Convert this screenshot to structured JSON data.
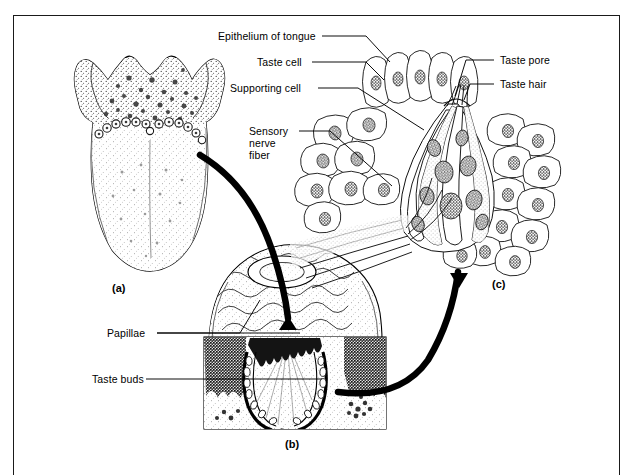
{
  "figure": {
    "background_color": "#ffffff",
    "ink_color": "#000000",
    "border_color": "#1a1a1a"
  },
  "labels": {
    "epithelium_of_tongue": "Epithelium of tongue",
    "taste_cell": "Taste cell",
    "supporting_cell": "Supporting cell",
    "sensory_nerve_fiber_line1": "Sensory",
    "sensory_nerve_fiber_line2": "nerve",
    "sensory_nerve_fiber_line3": "fiber",
    "taste_pore": "Taste pore",
    "taste_hair": "Taste hair",
    "papillae": "Papillae",
    "taste_buds": "Taste buds"
  },
  "panels": {
    "a": {
      "tag": "(a)",
      "subject": "dorsal-view-of-tongue"
    },
    "b": {
      "tag": "(b)",
      "subject": "block-section-of-circumvallate-papilla"
    },
    "c": {
      "tag": "(c)",
      "subject": "taste-bud-cellular-detail"
    }
  }
}
